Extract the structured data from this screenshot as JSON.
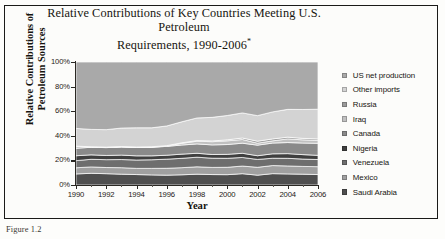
{
  "figure": {
    "title_line1": "Relative Contributions of Key Countries Meeting U.S. Petroleum",
    "title_line2": "Requirements, 1990-2006",
    "title_footnote": "*",
    "caption": "Figure 1.2"
  },
  "legend": {
    "position": "right",
    "items": [
      {
        "label": "US net production",
        "color": "#a9a9a9"
      },
      {
        "label": "Other imports",
        "color": "#d3d3d3"
      },
      {
        "label": "Russia",
        "color": "#9a9a9a"
      },
      {
        "label": "Iraq",
        "color": "#c0c0c0"
      },
      {
        "label": "Canada",
        "color": "#8a8a8a"
      },
      {
        "label": "Nigeria",
        "color": "#3f3f3f"
      },
      {
        "label": "Venezuela",
        "color": "#6e6e6e"
      },
      {
        "label": "Mexico",
        "color": "#a0a0a0"
      },
      {
        "label": "Saudi Arabia",
        "color": "#4f4f4f"
      }
    ]
  },
  "chart_data": {
    "type": "area",
    "stacked": true,
    "normalized": true,
    "title": "Relative Contributions of Key Countries Meeting U.S. Petroleum Requirements, 1990-2006*",
    "xlabel": "Year",
    "ylabel": "Relative Contributions of Petroleum Sources",
    "xlim": [
      1990,
      2006
    ],
    "ylim": [
      0,
      100
    ],
    "yticks": [
      "0%",
      "20%",
      "40%",
      "60%",
      "80%",
      "100%"
    ],
    "ytick_values": [
      0,
      20,
      40,
      60,
      80,
      100
    ],
    "xticks": [
      1990,
      1992,
      1994,
      1996,
      1998,
      2000,
      2002,
      2004,
      2006
    ],
    "x": [
      1990,
      1991,
      1992,
      1993,
      1994,
      1995,
      1996,
      1997,
      1998,
      1999,
      2000,
      2001,
      2002,
      2003,
      2004,
      2005,
      2006
    ],
    "grid": false,
    "series": [
      {
        "name": "Saudi Arabia",
        "color": "#4f4f4f",
        "values": [
          9.0,
          9.5,
          9.2,
          8.8,
          8.5,
          8.2,
          8.0,
          8.3,
          8.8,
          8.5,
          8.4,
          9.2,
          8.0,
          9.3,
          9.0,
          8.8,
          8.5
        ]
      },
      {
        "name": "Mexico",
        "color": "#a0a0a0",
        "values": [
          5.0,
          5.2,
          5.0,
          5.3,
          5.0,
          5.3,
          5.6,
          5.8,
          6.0,
          5.8,
          6.0,
          6.2,
          6.4,
          6.6,
          6.5,
          6.3,
          6.4
        ]
      },
      {
        "name": "Venezuela",
        "color": "#6e6e6e",
        "values": [
          5.8,
          6.2,
          6.4,
          6.6,
          6.8,
          7.0,
          7.4,
          7.6,
          7.8,
          7.5,
          7.3,
          7.0,
          6.4,
          6.0,
          6.2,
          6.0,
          5.8
        ]
      },
      {
        "name": "Nigeria",
        "color": "#3f3f3f",
        "values": [
          4.0,
          3.6,
          3.4,
          3.6,
          3.4,
          3.2,
          3.2,
          3.4,
          3.2,
          3.0,
          3.2,
          3.4,
          3.0,
          3.6,
          3.8,
          3.6,
          3.4
        ]
      },
      {
        "name": "Canada",
        "color": "#8a8a8a",
        "values": [
          6.0,
          6.2,
          6.4,
          6.6,
          6.8,
          7.0,
          7.2,
          7.4,
          7.6,
          7.8,
          8.0,
          8.2,
          8.6,
          8.8,
          9.0,
          9.4,
          9.8
        ]
      },
      {
        "name": "Iraq",
        "color": "#c0c0c0",
        "values": [
          1.6,
          0.2,
          0.1,
          0.1,
          0.1,
          0.1,
          0.2,
          1.4,
          2.2,
          2.6,
          3.0,
          3.0,
          1.6,
          1.8,
          3.0,
          2.6,
          2.4
        ]
      },
      {
        "name": "Russia",
        "color": "#9a9a9a",
        "values": [
          0.2,
          0.2,
          0.3,
          0.3,
          0.3,
          0.3,
          0.4,
          0.4,
          0.5,
          0.6,
          0.8,
          1.2,
          1.6,
          1.6,
          1.4,
          1.2,
          1.2
        ]
      },
      {
        "name": "Other imports",
        "color": "#d3d3d3",
        "values": [
          14.4,
          14.1,
          14.2,
          15.0,
          15.6,
          15.4,
          16.0,
          17.1,
          18.4,
          19.2,
          19.8,
          20.4,
          20.8,
          22.1,
          22.6,
          23.5,
          24.1
        ]
      },
      {
        "name": "US net production",
        "color": "#a9a9a9",
        "values": [
          54.0,
          54.8,
          55.0,
          53.7,
          53.5,
          53.5,
          52.0,
          48.6,
          45.5,
          45.0,
          43.5,
          41.4,
          43.6,
          40.8,
          38.5,
          38.6,
          38.4
        ]
      }
    ]
  }
}
